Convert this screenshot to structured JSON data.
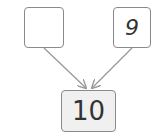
{
  "diagram": {
    "type": "number-bond",
    "parts": [
      {
        "id": "left",
        "value": ""
      },
      {
        "id": "right",
        "value": "9"
      }
    ],
    "whole": {
      "value": "10"
    },
    "colors": {
      "border": "#8a8a8a",
      "arrow": "#999999",
      "whole_fill": "#f0f0f0",
      "text": "#333333"
    }
  }
}
